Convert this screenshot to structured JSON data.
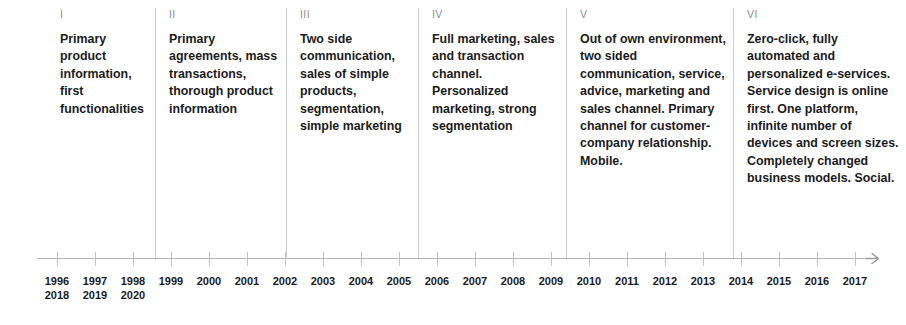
{
  "diagram": {
    "type": "timeline",
    "orientation": "horizontal",
    "arrow_direction": "right",
    "divider_color": "#cfcfcf",
    "axis_color": "#b3b3b3",
    "text_color": "#1b1b1b",
    "numeral_color": "#8d8d8d"
  },
  "phases": [
    {
      "numeral": "I",
      "text": "Primary product information, first functionalities",
      "x": 46,
      "width": 110,
      "divider": false
    },
    {
      "numeral": "II",
      "text": "Primary agreements, mass transactions, thorough product information",
      "x": 155,
      "width": 131,
      "divider": true
    },
    {
      "numeral": "III",
      "text": "Two side communication, sales of simple products, segmentation, simple marketing",
      "x": 286,
      "width": 132,
      "divider": true
    },
    {
      "numeral": "IV",
      "text": "Full marketing, sales and transaction channel. Personalized marketing, strong segmentation",
      "x": 418,
      "width": 148,
      "divider": true
    },
    {
      "numeral": "V",
      "text": "Out of own environment, two sided communication, service, advice, marketing and sales channel. Primary channel for customer-company relationship. Mobile.",
      "x": 566,
      "width": 167,
      "divider": true
    },
    {
      "numeral": "VI",
      "text": "Zero-click, fully automated and personalized e-services. Service design is online first. One platform, infinite number of devices and screen sizes. Completely changed business models. Social.",
      "x": 733,
      "width": 170,
      "divider": true
    }
  ],
  "axis": {
    "start_x": 38,
    "end_x": 878,
    "tick_spacing": 38,
    "first_tick_x": 57,
    "years": [
      {
        "primary": "1996",
        "secondary": "2018"
      },
      {
        "primary": "1997",
        "secondary": "2019"
      },
      {
        "primary": "1998",
        "secondary": "2020"
      },
      {
        "primary": "1999",
        "secondary": ""
      },
      {
        "primary": "2000",
        "secondary": ""
      },
      {
        "primary": "2001",
        "secondary": ""
      },
      {
        "primary": "2002",
        "secondary": ""
      },
      {
        "primary": "2003",
        "secondary": ""
      },
      {
        "primary": "2004",
        "secondary": ""
      },
      {
        "primary": "2005",
        "secondary": ""
      },
      {
        "primary": "2006",
        "secondary": ""
      },
      {
        "primary": "2007",
        "secondary": ""
      },
      {
        "primary": "2008",
        "secondary": ""
      },
      {
        "primary": "2009",
        "secondary": ""
      },
      {
        "primary": "2010",
        "secondary": ""
      },
      {
        "primary": "2011",
        "secondary": ""
      },
      {
        "primary": "2012",
        "secondary": ""
      },
      {
        "primary": "2013",
        "secondary": ""
      },
      {
        "primary": "2014",
        "secondary": ""
      },
      {
        "primary": "2015",
        "secondary": ""
      },
      {
        "primary": "2016",
        "secondary": ""
      },
      {
        "primary": "2017",
        "secondary": ""
      }
    ]
  }
}
